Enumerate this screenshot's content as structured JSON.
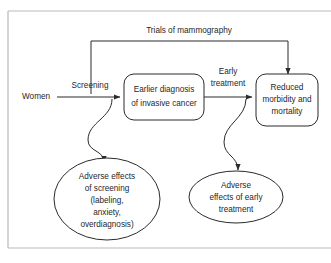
{
  "diagram": {
    "title": "Trials of mammography",
    "type": "causal-pathway-flowchart",
    "colors": {
      "stroke": "#2b2b2b",
      "text": "#1f1f1f",
      "frame": "#b9b9b9",
      "background": "#ffffff"
    },
    "nodes": {
      "women": {
        "label": "Women",
        "shape": "text"
      },
      "earlier_diagnosis": {
        "shape": "rounded-rect",
        "lines": [
          "Earlier diagnosis",
          "of invasive cancer"
        ]
      },
      "reduced_morbidity": {
        "shape": "rounded-rect",
        "lines": [
          "Reduced",
          "morbidity and",
          "mortality"
        ]
      },
      "adverse_screening": {
        "shape": "ellipse",
        "lines": [
          "Adverse effects",
          "of screening",
          "(labeling,",
          "anxiety,",
          "overdiagnosis)"
        ]
      },
      "adverse_treatment": {
        "shape": "ellipse",
        "lines": [
          "Adverse",
          "effects of early",
          "treatment"
        ]
      }
    },
    "edge_labels": {
      "screening": "Screening",
      "early_treatment_line1": "Early",
      "early_treatment_line2": "treatment",
      "trials_bracket": "Trials of mammography"
    }
  }
}
